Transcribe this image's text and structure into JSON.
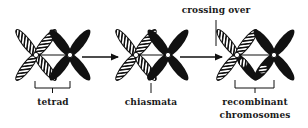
{
  "diagram": {
    "stages": [
      {
        "id": "tetrad",
        "label": "tetrad"
      },
      {
        "id": "chiasmata",
        "label": "chiasmata"
      },
      {
        "id": "recombinant",
        "label_line1": "recombinant",
        "label_line2": "chromosomes"
      }
    ],
    "process_label": "crossing over",
    "colors": {
      "black_chromosome": "#111111",
      "hatched_chromosome_stroke": "#111111",
      "background": "#ffffff"
    },
    "icons": {
      "arrow": "right-arrow",
      "bracket": "bracket-under",
      "pointer": "tick-line"
    }
  }
}
